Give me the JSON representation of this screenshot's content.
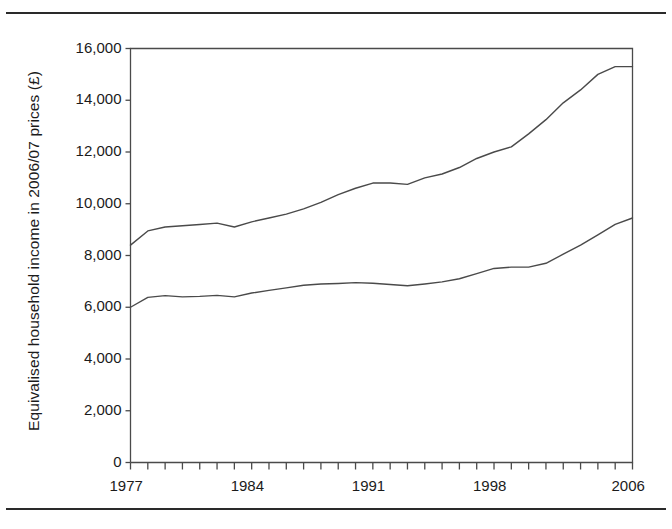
{
  "figure": {
    "y_axis_title": "Equivalised household income in 2006/07 prices (£)"
  },
  "chart_data": {
    "type": "line",
    "title": "",
    "subtitle": "",
    "xlabel": "",
    "ylabel": "Equivalised household income in 2006/07 prices (£)",
    "xlim": [
      1977,
      2006
    ],
    "ylim": [
      0,
      16000
    ],
    "grid": false,
    "legend": "none",
    "y_ticks": [
      0,
      2000,
      4000,
      6000,
      8000,
      10000,
      12000,
      14000,
      16000
    ],
    "y_tick_labels": [
      "0",
      "2,000",
      "4,000",
      "6,000",
      "8,000",
      "10,000",
      "12,000",
      "14,000",
      "16,000"
    ],
    "x_ticks": [
      1977,
      1978,
      1979,
      1980,
      1981,
      1982,
      1983,
      1984,
      1985,
      1986,
      1987,
      1988,
      1989,
      1990,
      1991,
      1992,
      1993,
      1994,
      1995,
      1996,
      1997,
      1998,
      1999,
      2000,
      2001,
      2002,
      2003,
      2004,
      2005,
      2006
    ],
    "x_tick_labels_shown": [
      "1977",
      "1984",
      "1991",
      "1998",
      "2006"
    ],
    "x_tick_labels_shown_at": [
      1977,
      1984,
      1991,
      1998,
      2006
    ],
    "line_color": "#4a4a4a",
    "frame_color": "#4a4a4a",
    "x": [
      1977,
      1978,
      1979,
      1980,
      1981,
      1982,
      1983,
      1984,
      1985,
      1986,
      1987,
      1988,
      1989,
      1990,
      1991,
      1992,
      1993,
      1994,
      1995,
      1996,
      1997,
      1998,
      1999,
      2000,
      2001,
      2002,
      2003,
      2004,
      2005,
      2006
    ],
    "series": [
      {
        "name": "mean income",
        "values": [
          8400,
          8950,
          9100,
          9150,
          9200,
          9250,
          9100,
          9300,
          9450,
          9600,
          9800,
          10050,
          10350,
          10600,
          10800,
          10800,
          10750,
          11000,
          11150,
          11400,
          11750,
          12000,
          12200,
          12700,
          13250,
          13900,
          14400,
          15000,
          15300,
          15300
        ]
      },
      {
        "name": "median income",
        "values": [
          6000,
          6380,
          6450,
          6400,
          6420,
          6460,
          6400,
          6550,
          6650,
          6750,
          6850,
          6900,
          6920,
          6950,
          6930,
          6880,
          6830,
          6900,
          6980,
          7100,
          7300,
          7500,
          7550,
          7550,
          7700,
          8050,
          8400,
          8800,
          9200,
          9450
        ]
      }
    ]
  }
}
